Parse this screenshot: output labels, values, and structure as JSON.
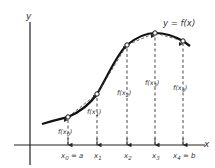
{
  "diagram": {
    "title": "y = f(x)",
    "axis_labels": {
      "x": "x",
      "y": "y"
    },
    "colors": {
      "curve": "#111111",
      "axis": "#222222",
      "dashed": "#333333",
      "text": "#333333"
    },
    "points": [
      {
        "x_label": "x0 = a",
        "x_sub": "0",
        "x_suffix": " = a",
        "f_label": "f(x0)",
        "f_sub": "0"
      },
      {
        "x_label": "x1",
        "x_sub": "1",
        "x_suffix": "",
        "f_label": "f(x1)",
        "f_sub": "1"
      },
      {
        "x_label": "x2",
        "x_sub": "2",
        "x_suffix": "",
        "f_label": "f(x2)",
        "f_sub": "2"
      },
      {
        "x_label": "x3",
        "x_sub": "3",
        "x_suffix": "",
        "f_label": "f(x3)",
        "f_sub": "3"
      },
      {
        "x_label": "x4 = b",
        "x_sub": "4",
        "x_suffix": " = b",
        "f_label": "f(x4)",
        "f_sub": "4"
      }
    ],
    "text": {
      "x_base": "x",
      "f_open": "f(x",
      "f_close": ")"
    }
  }
}
